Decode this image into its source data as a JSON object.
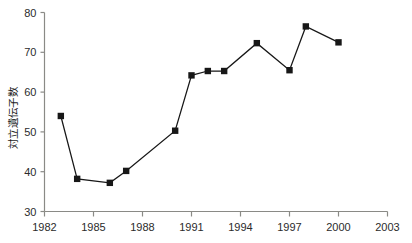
{
  "chart_data": {
    "type": "line",
    "title": "",
    "subtitle": "",
    "xlabel": "",
    "ylabel": "対立遺伝子数",
    "xlim": [
      1982,
      2003
    ],
    "ylim": [
      30,
      80
    ],
    "xticks": [
      1982,
      1985,
      1988,
      1991,
      1994,
      1997,
      2000,
      2003
    ],
    "xtick_labels": [
      "1982",
      "1985",
      "1988",
      "1991",
      "1994",
      "1997",
      "2000",
      "2003"
    ],
    "yticks": [
      30,
      40,
      50,
      60,
      70,
      80
    ],
    "ytick_labels": [
      "30",
      "40",
      "50",
      "60",
      "70",
      "80"
    ],
    "grid": false,
    "legend": false,
    "legend_position": "none",
    "marker": "square",
    "marker_color": "#171717",
    "line_color": "#171717",
    "axis_color": "#8a8a86",
    "x": [
      1983,
      1984,
      1986,
      1987,
      1990,
      1991,
      1992,
      1993,
      1995,
      1997,
      1998,
      2000
    ],
    "values": [
      54.0,
      38.2,
      37.2,
      40.2,
      50.3,
      64.2,
      65.3,
      65.3,
      72.3,
      65.5,
      76.5,
      72.5
    ],
    "points": [
      {
        "x": 1983,
        "y": 54.0
      },
      {
        "x": 1984,
        "y": 38.2
      },
      {
        "x": 1986,
        "y": 37.2
      },
      {
        "x": 1987,
        "y": 40.2
      },
      {
        "x": 1990,
        "y": 50.3
      },
      {
        "x": 1991,
        "y": 64.2
      },
      {
        "x": 1992,
        "y": 65.3
      },
      {
        "x": 1993,
        "y": 65.3
      },
      {
        "x": 1995,
        "y": 72.3
      },
      {
        "x": 1997,
        "y": 65.5
      },
      {
        "x": 1998,
        "y": 76.5
      },
      {
        "x": 2000,
        "y": 72.5
      }
    ]
  }
}
